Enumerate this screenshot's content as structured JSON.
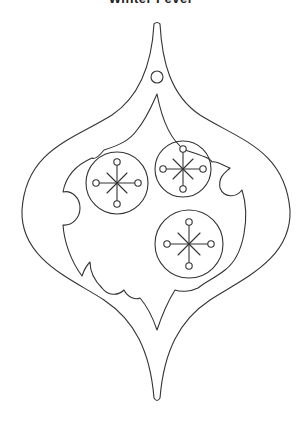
{
  "title": "Winter Fever",
  "artwork": {
    "subject": "ornament-coloring-page",
    "stroke_color": "#333333",
    "background": "#ffffff",
    "snowflake_count": 3
  }
}
